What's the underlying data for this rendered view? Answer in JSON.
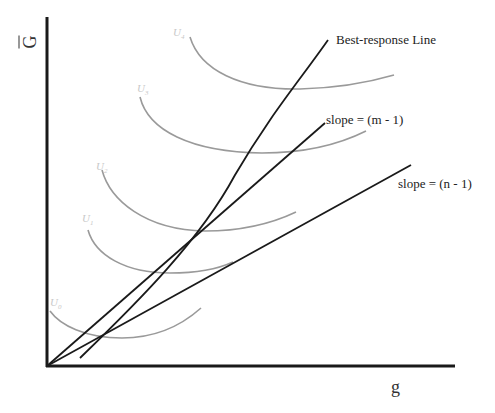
{
  "diagram": {
    "type": "economics-indifference-curve-diagram",
    "axes": {
      "y_label": "G",
      "y_label_overbar": true,
      "x_label": "g"
    },
    "lines": [
      {
        "id": "best-response",
        "label": "Best-response Line"
      },
      {
        "id": "slope-m",
        "label": "slope = (m - 1)"
      },
      {
        "id": "slope-n",
        "label": "slope = (n - 1)"
      }
    ],
    "indifference_curves": [
      {
        "id": "U4",
        "symbol": "U",
        "subscript": "4"
      },
      {
        "id": "U3",
        "symbol": "U",
        "subscript": "3"
      },
      {
        "id": "U2",
        "symbol": "U",
        "subscript": "2"
      },
      {
        "id": "U1",
        "symbol": "U",
        "subscript": "1"
      },
      {
        "id": "U0",
        "symbol": "U",
        "subscript": "0"
      }
    ],
    "colors": {
      "axis": "#1a1a1a",
      "lines": "#1a1a1a",
      "curves": "#9a9a9a",
      "curve_labels": "#c8c8c8"
    }
  }
}
